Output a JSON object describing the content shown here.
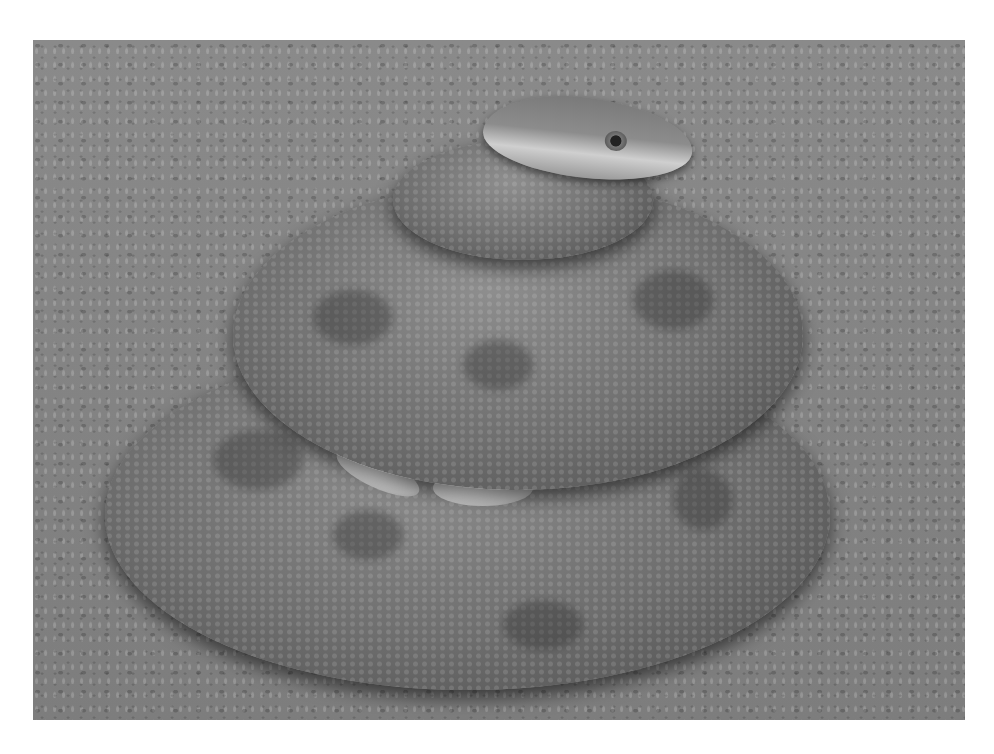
{
  "image": {
    "subject": "coiled python brooding eggs on sand",
    "style": "grayscale photograph",
    "colors": {
      "page_background": "#ffffff",
      "sand": "#848484",
      "snake_body": "#6e6e6e",
      "snake_shadow": "#4a4a4a",
      "belly_highlight": "#cfcfcf",
      "eggs": "#e8e8e8"
    }
  }
}
